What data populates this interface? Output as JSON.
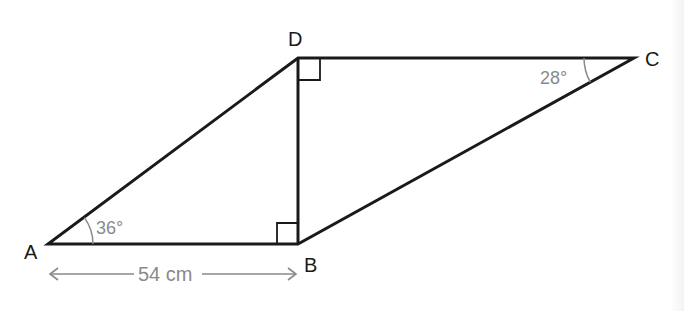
{
  "diagram": {
    "title": "",
    "vertices": {
      "A": {
        "label": "A",
        "x": 48,
        "y": 244
      },
      "B": {
        "label": "B",
        "x": 298,
        "y": 244
      },
      "C": {
        "label": "C",
        "x": 634,
        "y": 58
      },
      "D": {
        "label": "D",
        "x": 298,
        "y": 58
      }
    },
    "edges": [
      "AB",
      "BC",
      "CD",
      "DA",
      "DB"
    ],
    "angles": {
      "A": "36°",
      "C": "28°"
    },
    "right_angles": [
      "B (angle ABD)",
      "D (angle BDC)"
    ],
    "dimension": {
      "label": "54 cm",
      "from": "A",
      "to": "B"
    },
    "colors": {
      "line": "#1a1a1a",
      "annotation": "#8a8a8a",
      "background": "#ffffff"
    }
  }
}
